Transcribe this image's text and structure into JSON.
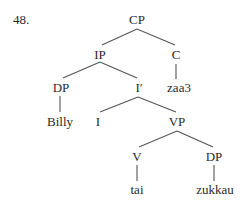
{
  "example_number": "48.",
  "tree": {
    "nodes": {
      "cp": {
        "label": "CP",
        "x": 137,
        "y": 13
      },
      "ip": {
        "label": "IP",
        "x": 100,
        "y": 48
      },
      "c": {
        "label": "C",
        "x": 176,
        "y": 48
      },
      "dp1": {
        "label": "DP",
        "x": 61,
        "y": 81
      },
      "ibar": {
        "label": "I′",
        "x": 139,
        "y": 81
      },
      "zaa3": {
        "label": "zaa3",
        "x": 179,
        "y": 81
      },
      "billy": {
        "label": "Billy",
        "x": 60,
        "y": 115
      },
      "i": {
        "label": "I",
        "x": 98,
        "y": 115
      },
      "vp": {
        "label": "VP",
        "x": 177,
        "y": 115
      },
      "v": {
        "label": "V",
        "x": 137,
        "y": 150
      },
      "dp2": {
        "label": "DP",
        "x": 214,
        "y": 150
      },
      "tai": {
        "label": "tai",
        "x": 137,
        "y": 183
      },
      "zukkau": {
        "label": "zukkau",
        "x": 215,
        "y": 183
      }
    }
  }
}
